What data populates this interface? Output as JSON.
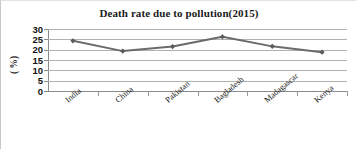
{
  "chart_data": {
    "type": "line",
    "title": "Death rate due to pollution(2015)",
    "xlabel": "",
    "ylabel": "( %)",
    "categories": [
      "India",
      "China",
      "Pakistan",
      "Bagladesh",
      "Madagascar",
      "Kenya"
    ],
    "values": [
      24.3,
      19.3,
      21.5,
      26.2,
      21.6,
      18.8
    ],
    "series": [
      {
        "name": "Death rate",
        "values": [
          24.3,
          19.3,
          21.5,
          26.2,
          21.6,
          18.8
        ]
      }
    ],
    "ylim": [
      0,
      30
    ],
    "ytick_labels": [
      "30",
      "25",
      "20",
      "15",
      "10",
      "5",
      "0"
    ],
    "ytick_values": [
      30,
      25,
      20,
      15,
      10,
      5,
      0
    ],
    "grid": "horizontal",
    "legend": "none",
    "marker": "diamond",
    "colors": {
      "line": "#6b6b6b",
      "marker": "#5a5a5a",
      "gridline": "#b0b0b0",
      "axis": "#8a8a8a",
      "text": "#1a1a1a",
      "background": "#ffffff"
    }
  }
}
